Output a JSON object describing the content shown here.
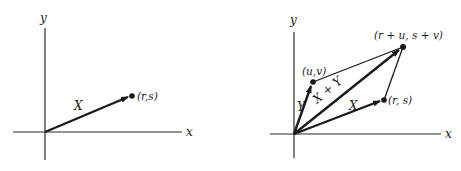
{
  "left_panel": {
    "axes": {
      "x_label": "x",
      "y_label": "y"
    },
    "vector": {
      "label": "X",
      "tip_label": "(r,s)"
    }
  },
  "right_panel": {
    "axes": {
      "x_label": "x",
      "y_label": "y"
    },
    "vectors": [
      {
        "label": "X",
        "tip_label": "(r, s)"
      },
      {
        "label": "Y",
        "tip_label": "(u,v)"
      },
      {
        "label": "X + Y",
        "tip_label": "(r + u, s + v)"
      }
    ]
  },
  "colors": {
    "ink": "#1a1a1a",
    "background": "#ffffff"
  }
}
